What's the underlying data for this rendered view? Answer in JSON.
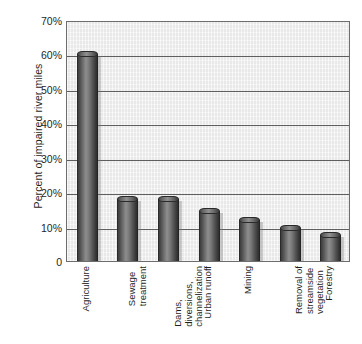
{
  "chart_data": {
    "type": "bar",
    "title": "",
    "xlabel": "",
    "ylabel": "Percent of impaired river miles",
    "ylim": [
      0,
      70
    ],
    "grid": true,
    "legend": "none",
    "orientation": "vertical",
    "categories": [
      "Agriculture",
      "Sewage treatment",
      "Dams, diversions, channelization",
      "Urban runoff",
      "Mining",
      "Removal of streamside vegetation",
      "Forestry"
    ],
    "category_lines": [
      [
        "Agriculture"
      ],
      [
        "Sewage",
        "treatment"
      ],
      [
        "Dams,",
        "diversions,",
        "channelization"
      ],
      [
        "Urban runoff"
      ],
      [
        "Mining"
      ],
      [
        "Removal of",
        "streamside",
        "vegetation"
      ],
      [
        "Forestry"
      ]
    ],
    "values": [
      60,
      18,
      18,
      14.5,
      12,
      9.5,
      7.5
    ],
    "yticks": [
      0,
      10,
      20,
      30,
      40,
      50,
      60,
      70
    ],
    "ytick_labels": [
      "0",
      "10%",
      "20%",
      "30%",
      "40%",
      "50%",
      "60%",
      "70%"
    ],
    "bar_style": "3d-cylinder",
    "colors": {
      "plot_background": "#eeeeee",
      "axis": "#6d6d6d",
      "gridline": "#5f5f5f",
      "bar_dark": "#2e2e2e",
      "bar_light": "#909090",
      "text": "#1f1f1f"
    }
  }
}
